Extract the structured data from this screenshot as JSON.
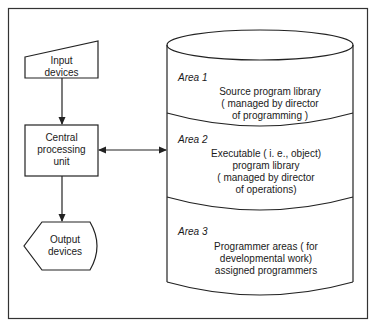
{
  "diagram": {
    "input": {
      "line1": "Input",
      "line2": "devices"
    },
    "cpu": {
      "line1": "Central",
      "line2": "processing",
      "line3": "unit"
    },
    "output": {
      "line1": "Output",
      "line2": "devices"
    },
    "areas": [
      {
        "title": "Area 1",
        "line1": "Source program library",
        "line2": "( managed by director",
        "line3": "of programming )"
      },
      {
        "title": "Area 2",
        "line1": "Executable ( i. e., object)",
        "line2": "program library",
        "line3": "( managed by director",
        "line4": "of operations)"
      },
      {
        "title": "Area 3",
        "line1": "Programmer areas ( for",
        "line2": "developmental work)",
        "line3": "assigned programmers"
      }
    ],
    "colors": {
      "stroke": "#222222",
      "background": "#ffffff"
    }
  }
}
